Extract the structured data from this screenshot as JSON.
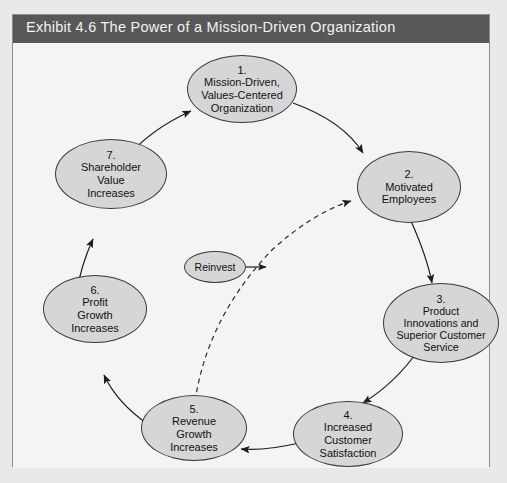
{
  "header": {
    "title": "Exhibit 4.6  The Power of a Mission-Driven Organization"
  },
  "diagram": {
    "type": "cycle-flow-diagram",
    "node_fill": "#d6d6d6",
    "node_stroke": "#3a3a3a",
    "header_bg": "#585858",
    "paper_bg": "#f4f4f4",
    "nodes": [
      {
        "id": "n1",
        "number": "1.",
        "label": "Mission-Driven,\nValues-Centered\nOrganization",
        "line1": "1.",
        "line2": "Mission-Driven,",
        "line3": "Values-Centered",
        "line4": "Organization"
      },
      {
        "id": "n2",
        "number": "2.",
        "label": "Motivated\nEmployees",
        "line1": "2.",
        "line2": "Motivated",
        "line3": "Employees",
        "line4": ""
      },
      {
        "id": "n3",
        "number": "3.",
        "label": "Product\nInnovations and\nSuperior Customer\nService",
        "line1": "3.",
        "line2": "Product",
        "line3": "Innovations and",
        "line4": "Superior Customer",
        "line5": "Service"
      },
      {
        "id": "n4",
        "number": "4.",
        "label": "Increased\nCustomer\nSatisfaction",
        "line1": "4.",
        "line2": "Increased",
        "line3": "Customer",
        "line4": "Satisfaction"
      },
      {
        "id": "n5",
        "number": "5.",
        "label": "Revenue\nGrowth\nIncreases",
        "line1": "5.",
        "line2": "Revenue",
        "line3": "Growth",
        "line4": "Increases"
      },
      {
        "id": "n6",
        "number": "6.",
        "label": "Profit\nGrowth\nIncreases",
        "line1": "6.",
        "line2": "Profit",
        "line3": "Growth",
        "line4": "Increases"
      },
      {
        "id": "n7",
        "number": "7.",
        "label": "Shareholder\nValue\nIncreases",
        "line1": "7.",
        "line2": "Shareholder",
        "line3": "Value",
        "line4": "Increases"
      }
    ],
    "annotation": {
      "id": "reinvest",
      "label": "Reinvest"
    },
    "edges": [
      {
        "from": "1",
        "to": "2",
        "style": "solid"
      },
      {
        "from": "2",
        "to": "3",
        "style": "solid"
      },
      {
        "from": "3",
        "to": "4",
        "style": "solid"
      },
      {
        "from": "4",
        "to": "5",
        "style": "solid"
      },
      {
        "from": "5",
        "to": "6",
        "style": "solid"
      },
      {
        "from": "6",
        "to": "7",
        "style": "solid"
      },
      {
        "from": "7",
        "to": "1",
        "style": "solid"
      },
      {
        "from": "5",
        "to": "2",
        "style": "dashed",
        "label": "Reinvest"
      }
    ]
  }
}
